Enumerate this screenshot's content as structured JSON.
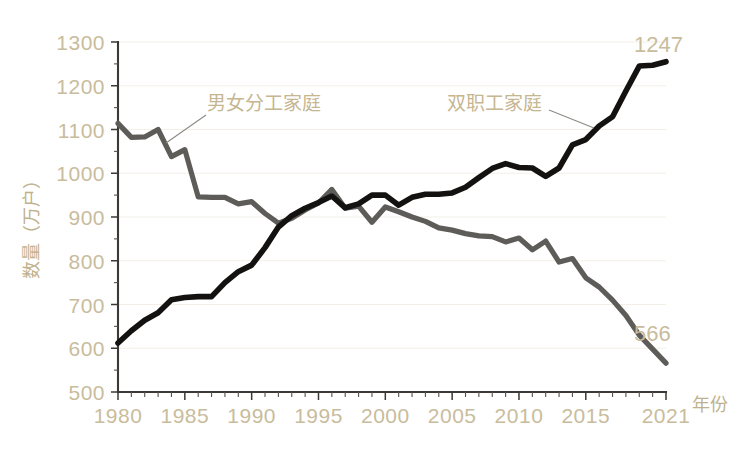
{
  "chart_data": {
    "type": "line",
    "title": "",
    "xlabel": "年份",
    "ylabel": "数量（万户）",
    "ylim": [
      500,
      1300
    ],
    "xlim": [
      1980,
      2021
    ],
    "grid": true,
    "legend_position": "inline-annotation",
    "y_ticks": [
      500,
      600,
      700,
      800,
      900,
      1000,
      1100,
      1200,
      1300
    ],
    "x_ticks": [
      1980,
      1985,
      1990,
      1995,
      2000,
      2005,
      2010,
      2015,
      2021
    ],
    "x_tick_labels": [
      "1980",
      "1985",
      "1990",
      "1995",
      "2000",
      "2005",
      "2010",
      "2015",
      "2021"
    ],
    "y_tick_labels": [
      "500",
      "600",
      "700",
      "800",
      "900",
      "1000",
      "1100",
      "1200",
      "1300"
    ],
    "x": [
      1980,
      1981,
      1982,
      1983,
      1984,
      1985,
      1986,
      1987,
      1988,
      1989,
      1990,
      1991,
      1992,
      1993,
      1994,
      1995,
      1996,
      1997,
      1998,
      1999,
      2000,
      2001,
      2002,
      2003,
      2004,
      2005,
      2006,
      2007,
      2008,
      2009,
      2010,
      2011,
      2012,
      2013,
      2014,
      2015,
      2016,
      2017,
      2018,
      2019,
      2020,
      2021
    ],
    "series": [
      {
        "name": "男女分工家庭",
        "color": "#5e5c58",
        "annotation": "男女分工家庭",
        "end_label": "566",
        "values": [
          1114,
          1082,
          1083,
          1100,
          1038,
          1054,
          946,
          945,
          945,
          930,
          935,
          908,
          886,
          897,
          916,
          932,
          963,
          920,
          925,
          888,
          923,
          912,
          900,
          890,
          875,
          870,
          862,
          857,
          855,
          843,
          852,
          825,
          845,
          797,
          805,
          761,
          740,
          710,
          675,
          630,
          598,
          566
        ]
      },
      {
        "name": "双职工家庭",
        "color": "#141210",
        "annotation": "双职工家庭",
        "end_label": "1247",
        "values": [
          612,
          640,
          664,
          681,
          711,
          716,
          718,
          718,
          750,
          775,
          790,
          830,
          877,
          903,
          920,
          933,
          948,
          921,
          930,
          950,
          950,
          927,
          945,
          952,
          952,
          955,
          968,
          990,
          1011,
          1022,
          1013,
          1012,
          993,
          1012,
          1065,
          1077,
          1108,
          1129,
          1188,
          1245,
          1247,
          1255
        ]
      }
    ],
    "annotations": [
      {
        "text": "1247",
        "series": "双职工家庭",
        "kind": "end-value"
      },
      {
        "text": "566",
        "series": "男女分工家庭",
        "kind": "end-value"
      }
    ],
    "colors": {
      "axis_text": "#c9bc9c",
      "axis_line": "#3b3835",
      "grid": "#f3efe7",
      "background": "#ffffff",
      "series_gray": "#5e5c58",
      "series_black": "#141210",
      "annotation_text": "#c6b692",
      "leader_line": "#8d8a84"
    }
  }
}
